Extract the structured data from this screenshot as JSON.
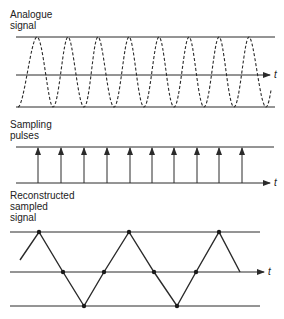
{
  "panels": {
    "analogue": {
      "label_line1": "Analogue",
      "label_line2": "signal",
      "axis_label": "t"
    },
    "sampling": {
      "label_line1": "Sampling",
      "label_line2": "pulses",
      "axis_label": "t"
    },
    "reconstructed": {
      "label_line1": "Reconstructed",
      "label_line2": "sampled",
      "label_line3": "signal",
      "axis_label": "t"
    }
  },
  "colors": {
    "line": "#2a2a2a",
    "background": "#ffffff"
  }
}
